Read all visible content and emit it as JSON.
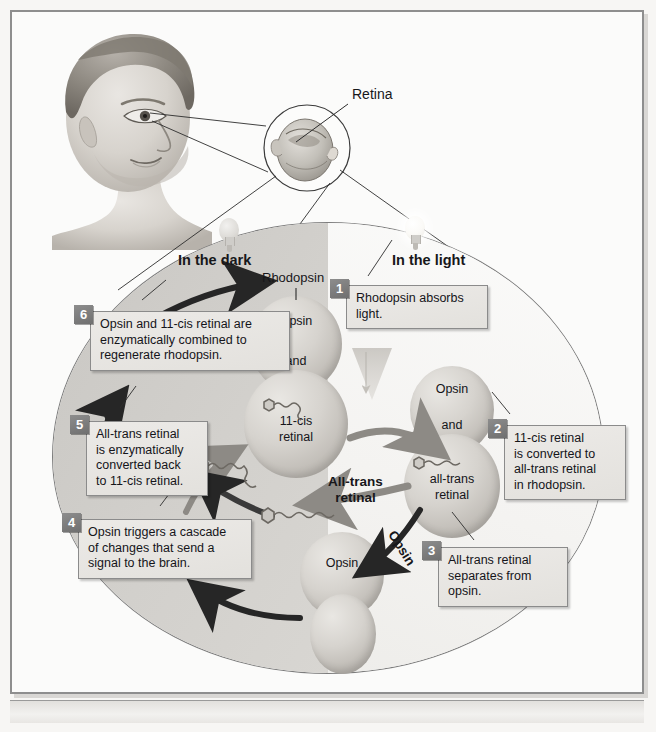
{
  "figure": {
    "anatomy_labels": [
      {
        "name": "retina",
        "text": "Retina"
      }
    ],
    "region_headers": [
      {
        "name": "dark",
        "text": "In the dark"
      },
      {
        "name": "light",
        "text": "In the light"
      }
    ],
    "pathway_labels": [
      {
        "name": "rhodopsin",
        "text": "Rhodopsin"
      },
      {
        "name": "all-trans-retinal",
        "text": "All-trans\nretinal"
      },
      {
        "name": "opsin-arrow",
        "text": "Opsin"
      }
    ],
    "molecules": [
      {
        "name": "rhodopsin-complex",
        "lines": [
          "Opsin",
          "and",
          "11-cis\nretinal"
        ]
      },
      {
        "name": "opsin-all-trans-complex",
        "lines": [
          "Opsin",
          "and",
          "all-trans\nretinal"
        ]
      },
      {
        "name": "free-opsin",
        "lines": [
          "Opsin"
        ]
      }
    ],
    "steps": [
      {
        "num": "1",
        "text": "Rhodopsin absorbs\nlight."
      },
      {
        "num": "2",
        "text": "11-cis retinal\nis converted to\nall-trans retinal\nin rhodopsin."
      },
      {
        "num": "3",
        "text": "All-trans retinal\nseparates from\nopsin."
      },
      {
        "num": "4",
        "text": "Opsin triggers a cascade\nof changes that send a\nsignal to the brain."
      },
      {
        "num": "5",
        "text": "All-trans retinal\nis enzymatically\nconverted back\nto 11-cis retinal."
      },
      {
        "num": "6",
        "text": "Opsin and 11-cis retinal are\nenzymatically combined to\nregenerate rhodopsin."
      }
    ],
    "colors": {
      "dark_half": "#d2d0cc",
      "light_half": "#f6f5f3",
      "callout_fill": "#e7e5e1",
      "number_badge": "#7c7c7c",
      "arrow_dark": "#2b2b2b",
      "arrow_gray": "#8a8782",
      "molecule": "#d2cfca",
      "frame": "#8e8e8e"
    }
  }
}
